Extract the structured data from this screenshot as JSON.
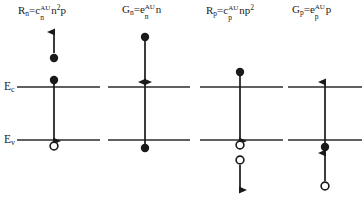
{
  "figure": {
    "band_labels": {
      "conduction": {
        "base": "E",
        "sub": "c",
        "x": 4,
        "y": 81
      },
      "valence": {
        "base": "E",
        "sub": "v",
        "x": 4,
        "y": 134
      }
    },
    "levels": {
      "Ec_y": 87,
      "Ev_y": 140
    },
    "colors": {
      "ink": "#1a1a1a",
      "line": "#2b2b2b",
      "background": "#ffffff"
    },
    "panels": [
      {
        "id": "Rn",
        "formula_parts": {
          "lhs_base": "R",
          "lhs_sub": "n",
          "equals": "=",
          "rhs_base": "c",
          "rhs_sub": "n",
          "rhs_sup": "AU",
          "tail": "n",
          "tail_sup": "2",
          "tail2": "p"
        },
        "formula_plain": "Rn=cnAUn2p",
        "formula_x": 18,
        "formula_y": 10,
        "axis_x": 54,
        "band_x1": 14,
        "band_x2": 100,
        "process": "electron-electron Auger recombination",
        "markers": [
          {
            "kind": "filled-circle",
            "x": 54,
            "y": 58,
            "r": 4.2,
            "name": "electron-excited"
          },
          {
            "kind": "filled-circle",
            "x": 54,
            "y": 80,
            "r": 4.2,
            "name": "electron-conduction"
          },
          {
            "kind": "open-circle",
            "x": 54,
            "y": 145,
            "r": 4.0,
            "name": "hole-valence"
          }
        ],
        "arrows": [
          {
            "name": "electron-excitation-up",
            "x": 54,
            "y1": 53,
            "y2": 31,
            "dir": "up"
          },
          {
            "name": "recombination-down",
            "x": 54,
            "y1": 84,
            "y2": 142,
            "dir": "down"
          }
        ]
      },
      {
        "id": "Gn",
        "formula_parts": {
          "lhs_base": "G",
          "lhs_sub": "n",
          "equals": "=",
          "rhs_base": "e",
          "rhs_sub": "n",
          "rhs_sup": "AU",
          "tail": "n",
          "tail_sup": "",
          "tail2": ""
        },
        "formula_plain": "Gn=enAUn",
        "formula_x": 122,
        "formula_y": 10,
        "axis_x": 145,
        "band_x1": 108,
        "band_x2": 190,
        "process": "electron Auger generation",
        "markers": [
          {
            "kind": "filled-circle",
            "x": 145,
            "y": 37,
            "r": 4.2,
            "name": "electron-hot"
          },
          {
            "kind": "filled-circle",
            "x": 145,
            "y": 148,
            "r": 4.2,
            "name": "electron-valence"
          }
        ],
        "arrows": [
          {
            "name": "relaxation-down",
            "x": 145,
            "y1": 41,
            "y2": 83,
            "dir": "down"
          },
          {
            "name": "generation-up",
            "x": 145,
            "y1": 144,
            "y2": 83,
            "dir": "up"
          }
        ]
      },
      {
        "id": "Rp",
        "formula_parts": {
          "lhs_base": "R",
          "lhs_sub": "p",
          "equals": "=",
          "rhs_base": "c",
          "rhs_sub": "p",
          "rhs_sup": "AU",
          "tail": "np",
          "tail_sup": "2",
          "tail2": ""
        },
        "formula_plain": "Rp=cpAUnp2",
        "formula_x": 206,
        "formula_y": 10,
        "axis_x": 240,
        "band_x1": 200,
        "band_x2": 283,
        "process": "hole-hole Auger recombination",
        "markers": [
          {
            "kind": "filled-circle",
            "x": 240,
            "y": 72,
            "r": 4.2,
            "name": "electron-conduction"
          },
          {
            "kind": "open-circle",
            "x": 240,
            "y": 144,
            "r": 4.0,
            "name": "hole-valence"
          },
          {
            "kind": "open-circle",
            "x": 240,
            "y": 159,
            "r": 4.0,
            "name": "hole-excited"
          }
        ],
        "arrows": [
          {
            "name": "recombination-down",
            "x": 240,
            "y1": 76,
            "y2": 140,
            "dir": "down"
          },
          {
            "name": "hole-excitation-down",
            "x": 240,
            "y1": 164,
            "y2": 190,
            "dir": "down"
          }
        ]
      },
      {
        "id": "Gp",
        "formula_parts": {
          "lhs_base": "G",
          "lhs_sub": "p",
          "equals": "=",
          "rhs_base": "e",
          "rhs_sub": "p",
          "rhs_sup": "AU",
          "tail": "p",
          "tail_sup": "",
          "tail2": ""
        },
        "formula_plain": "Gp=epAUp",
        "formula_x": 292,
        "formula_y": 10,
        "axis_x": 325,
        "band_x1": 288,
        "band_x2": 360,
        "process": "hole Auger generation",
        "markers": [
          {
            "kind": "filled-circle",
            "x": 325,
            "y": 147,
            "r": 4.2,
            "name": "electron-valence"
          },
          {
            "kind": "open-circle",
            "x": 325,
            "y": 185,
            "r": 4.0,
            "name": "hole-deep"
          }
        ],
        "arrows": [
          {
            "name": "generation-up",
            "x": 325,
            "y1": 143,
            "y2": 83,
            "dir": "up"
          },
          {
            "name": "hole-relaxation-up",
            "x": 325,
            "y1": 181,
            "y2": 153,
            "dir": "up"
          }
        ]
      }
    ]
  }
}
